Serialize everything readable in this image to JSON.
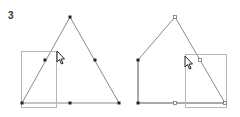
{
  "step": {
    "label": "3"
  },
  "colors": {
    "edge": "#8a8a8a",
    "edge_dark": "#555555",
    "selection": "#b5b5b5",
    "point": "#222222",
    "open_point": "#777777",
    "cursor_fill": "#ffffff",
    "cursor_stroke": "#222222"
  },
  "figures": [
    {
      "name": "triangle-before",
      "description": "Triangle with midpoints; marquee selection over left corner and left midpoint",
      "vertices": [
        [
          70,
          17
        ],
        [
          22,
          103
        ],
        [
          119,
          103
        ]
      ],
      "filled_points": [
        [
          70,
          17
        ],
        [
          22,
          103
        ],
        [
          119,
          103
        ],
        [
          45,
          60
        ],
        [
          95,
          60
        ],
        [
          70,
          103
        ]
      ],
      "selection_rect": {
        "x": 21,
        "y": 51,
        "w": 35,
        "h": 56
      },
      "cursor": [
        57,
        52
      ]
    },
    {
      "name": "pentagon-after",
      "description": "Shape after moving selected points; marquee selection over right corner",
      "vertices": [
        [
          175,
          17
        ],
        [
          225,
          103
        ],
        [
          138,
          103
        ],
        [
          138,
          60
        ]
      ],
      "filled_points": [
        [
          138,
          60
        ],
        [
          138,
          103
        ]
      ],
      "open_points": [
        [
          175,
          17
        ],
        [
          200,
          60
        ],
        [
          175,
          103
        ],
        [
          225,
          103
        ]
      ],
      "selection_rect": {
        "x": 185,
        "y": 54,
        "w": 41,
        "h": 53
      },
      "cursor": [
        185,
        57
      ]
    }
  ]
}
